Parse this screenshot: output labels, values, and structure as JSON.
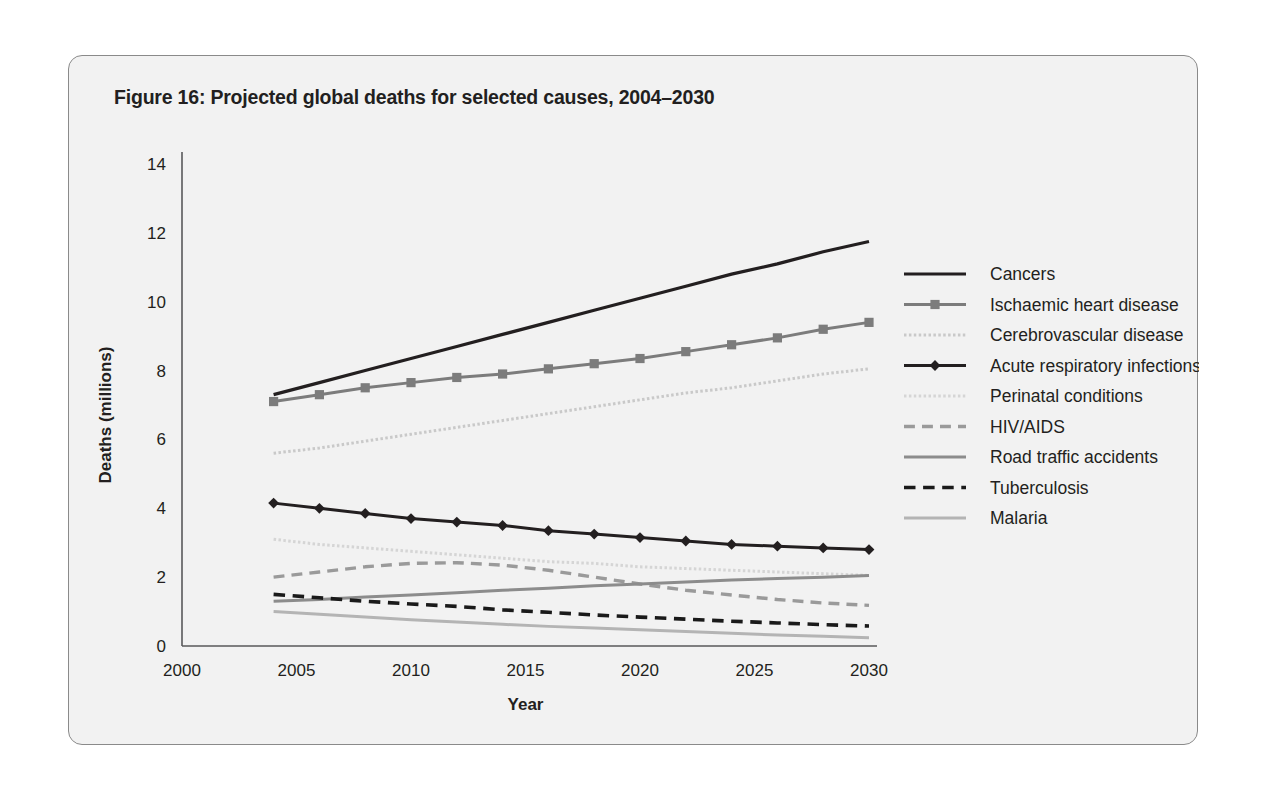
{
  "figure": {
    "title": "Figure 16: Projected global deaths for selected causes, 2004–2030"
  },
  "axes": {
    "x_title": "Year",
    "y_title": "Deaths (millions)",
    "x_ticks": [
      "2000",
      "2005",
      "2010",
      "2015",
      "2020",
      "2025",
      "2030"
    ],
    "y_ticks": [
      "0",
      "2",
      "4",
      "6",
      "8",
      "10",
      "12",
      "14"
    ]
  },
  "legend": {
    "items": [
      {
        "label": "Cancers",
        "style": "solid",
        "color": "#231f20",
        "width": 3.2,
        "marker": "none"
      },
      {
        "label": "Ischaemic heart disease",
        "style": "solid",
        "color": "#7c7c7c",
        "width": 3.0,
        "marker": "square"
      },
      {
        "label": "Cerebrovascular disease",
        "style": "dotted",
        "color": "#c9c9c9",
        "width": 3.0,
        "marker": "none"
      },
      {
        "label": "Acute respiratory infections",
        "style": "solid",
        "color": "#231f20",
        "width": 3.0,
        "marker": "diamond"
      },
      {
        "label": "Perinatal conditions",
        "style": "dotted",
        "color": "#d5d5d5",
        "width": 3.0,
        "marker": "none"
      },
      {
        "label": "HIV/AIDS",
        "style": "dashed",
        "color": "#9a9a9a",
        "width": 3.4,
        "marker": "none"
      },
      {
        "label": "Road traffic accidents",
        "style": "solid",
        "color": "#8c8c8c",
        "width": 3.0,
        "marker": "none"
      },
      {
        "label": "Tuberculosis",
        "style": "dashed",
        "color": "#1a1a1a",
        "width": 3.6,
        "marker": "none"
      },
      {
        "label": "Malaria",
        "style": "solid",
        "color": "#b4b4b4",
        "width": 3.0,
        "marker": "none"
      }
    ]
  },
  "chart_data": {
    "type": "line",
    "title": "Figure 16: Projected global deaths for selected causes, 2004–2030",
    "xlabel": "Year",
    "ylabel": "Deaths (millions)",
    "xlim": [
      2000,
      2030
    ],
    "ylim": [
      0,
      14
    ],
    "xticks": [
      2000,
      2005,
      2010,
      2015,
      2020,
      2025,
      2030
    ],
    "yticks": [
      0,
      2,
      4,
      6,
      8,
      10,
      12,
      14
    ],
    "grid": false,
    "legend_position": "right",
    "x": [
      2004,
      2006,
      2008,
      2010,
      2012,
      2014,
      2016,
      2018,
      2020,
      2022,
      2024,
      2026,
      2028,
      2030
    ],
    "series": [
      {
        "name": "Cancers",
        "values": [
          7.3,
          7.65,
          8.0,
          8.35,
          8.7,
          9.05,
          9.4,
          9.75,
          10.1,
          10.45,
          10.8,
          11.1,
          11.45,
          11.75
        ]
      },
      {
        "name": "Ischaemic heart disease",
        "values": [
          7.1,
          7.3,
          7.5,
          7.65,
          7.8,
          7.9,
          8.05,
          8.2,
          8.35,
          8.55,
          8.75,
          8.95,
          9.2,
          9.4
        ]
      },
      {
        "name": "Cerebrovascular disease",
        "values": [
          5.6,
          5.75,
          5.95,
          6.15,
          6.35,
          6.55,
          6.75,
          6.95,
          7.15,
          7.35,
          7.5,
          7.7,
          7.9,
          8.05
        ]
      },
      {
        "name": "Acute respiratory infections",
        "values": [
          4.15,
          4.0,
          3.85,
          3.7,
          3.6,
          3.5,
          3.35,
          3.25,
          3.15,
          3.05,
          2.95,
          2.9,
          2.85,
          2.8
        ]
      },
      {
        "name": "Perinatal conditions",
        "values": [
          3.1,
          2.95,
          2.85,
          2.75,
          2.65,
          2.55,
          2.45,
          2.4,
          2.3,
          2.25,
          2.2,
          2.15,
          2.1,
          2.05
        ]
      },
      {
        "name": "HIV/AIDS",
        "values": [
          2.0,
          2.15,
          2.3,
          2.4,
          2.42,
          2.35,
          2.2,
          2.0,
          1.8,
          1.62,
          1.48,
          1.35,
          1.25,
          1.18
        ]
      },
      {
        "name": "Road traffic accidents",
        "values": [
          1.3,
          1.35,
          1.42,
          1.48,
          1.55,
          1.62,
          1.68,
          1.75,
          1.8,
          1.86,
          1.92,
          1.96,
          2.0,
          2.05
        ]
      },
      {
        "name": "Tuberculosis",
        "values": [
          1.5,
          1.4,
          1.3,
          1.22,
          1.15,
          1.05,
          0.98,
          0.9,
          0.84,
          0.78,
          0.72,
          0.67,
          0.62,
          0.58
        ]
      },
      {
        "name": "Malaria",
        "values": [
          1.0,
          0.92,
          0.84,
          0.76,
          0.7,
          0.63,
          0.57,
          0.52,
          0.47,
          0.42,
          0.37,
          0.32,
          0.28,
          0.24
        ]
      }
    ]
  }
}
